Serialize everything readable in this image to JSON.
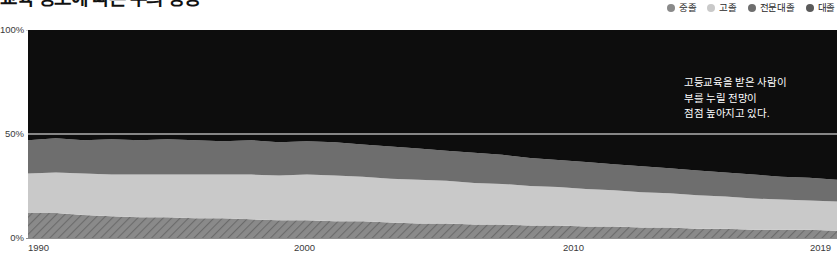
{
  "header": {
    "title": "교육 정도에 따른 부의 상승",
    "legend": [
      {
        "label": "중졸",
        "color": "#8a8a8a",
        "name": "legend-item-middle-school"
      },
      {
        "label": "고졸",
        "color": "#c9c9c9",
        "name": "legend-item-high-school"
      },
      {
        "label": "전문대졸",
        "color": "#6e6e6e",
        "name": "legend-item-junior-college"
      },
      {
        "label": "대졸",
        "color": "#5a5a5a",
        "name": "legend-item-college"
      }
    ]
  },
  "annotation": {
    "line1": "고등교육을 받은 사람이",
    "line2": "부를 누릴 전망이",
    "line3": "점점 높아지고 있다."
  },
  "axis": {
    "y_ticks": [
      "100%",
      "50%",
      "0%"
    ],
    "x_ticks": [
      {
        "label": "1990",
        "pos_px": 30
      },
      {
        "label": "2000",
        "pos_px": 296
      },
      {
        "label": "2010",
        "pos_px": 565
      },
      {
        "label": "2019",
        "pos_px": 812
      }
    ]
  },
  "chart_data": {
    "type": "area",
    "stacked": true,
    "normalized": true,
    "title": "교육 정도에 따른 부의 상승",
    "xlabel": "",
    "ylabel": "",
    "ylim": [
      0,
      100
    ],
    "xlim": [
      1990,
      2019
    ],
    "grid": true,
    "legend_position": "top-right",
    "annotation": "고등교육을 받은 사람이 부를 누릴 전망이 점점 높아지고 있다.",
    "x": [
      1990,
      1991,
      1992,
      1993,
      1994,
      1995,
      1996,
      1997,
      1998,
      1999,
      2000,
      2001,
      2002,
      2003,
      2004,
      2005,
      2006,
      2007,
      2008,
      2009,
      2010,
      2011,
      2012,
      2013,
      2014,
      2015,
      2016,
      2017,
      2018,
      2019
    ],
    "series": [
      {
        "name": "중졸",
        "color": "#8a8a8a",
        "pattern": "diagonal-hatch",
        "values": [
          12,
          12,
          11,
          10.5,
          10,
          10,
          9.5,
          9.5,
          9,
          8.5,
          8.5,
          8,
          8,
          7.5,
          7,
          7,
          6.5,
          6.5,
          6,
          6,
          5.5,
          5.5,
          5,
          5,
          4.5,
          4.5,
          4,
          4,
          4,
          3.5
        ]
      },
      {
        "name": "고졸",
        "color": "#c9c9c9",
        "pattern": "solid",
        "values": [
          19,
          19.5,
          20,
          20,
          20.5,
          20.5,
          21,
          21,
          21.5,
          21.5,
          22,
          22,
          21.5,
          21,
          21,
          20.5,
          20,
          19.5,
          19,
          18.5,
          18,
          17.5,
          17,
          16.5,
          16,
          15.5,
          15,
          14.5,
          14,
          14
        ]
      },
      {
        "name": "전문대졸",
        "color": "#6e6e6e",
        "pattern": "solid",
        "values": [
          16,
          16.5,
          16,
          17,
          16.5,
          17,
          16.5,
          16,
          16.5,
          16,
          16,
          16,
          15.5,
          15.5,
          15,
          14.5,
          14.5,
          14,
          13.5,
          13,
          13,
          12.5,
          12.5,
          12,
          12,
          11.5,
          11.5,
          11,
          11,
          10.5
        ]
      },
      {
        "name": "대졸",
        "color": "#0d0d0d",
        "pattern": "solid",
        "values": [
          53,
          52,
          53,
          52.5,
          53,
          52.5,
          53,
          53.5,
          53,
          54,
          53.5,
          54,
          55,
          56,
          57,
          58,
          59,
          60,
          61.5,
          62.5,
          63.5,
          64.5,
          65.5,
          66.5,
          67.5,
          68.5,
          69.5,
          70.5,
          71,
          72
        ]
      }
    ]
  }
}
